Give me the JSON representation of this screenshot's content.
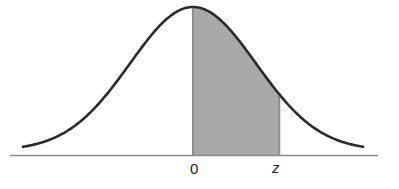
{
  "figure": {
    "colors": {
      "curve": "#2b2b2b",
      "axis": "#8a8a8a",
      "shade": "#a9a9a9",
      "shade_edge": "#8f8f8f",
      "background": "#ffffff"
    },
    "labels": {
      "zero": "0",
      "z": "z"
    }
  },
  "chart_data": {
    "type": "area",
    "title": "",
    "xlabel": "",
    "ylabel": "",
    "distribution": "standard normal",
    "mean": 0,
    "std": 1,
    "x_range": [
      -2.7,
      2.7
    ],
    "tick_labels": [
      "0",
      "z"
    ],
    "shaded_region": {
      "from": 0,
      "to": "z",
      "approx_z": 1.37
    },
    "grid": false,
    "legend": null
  }
}
